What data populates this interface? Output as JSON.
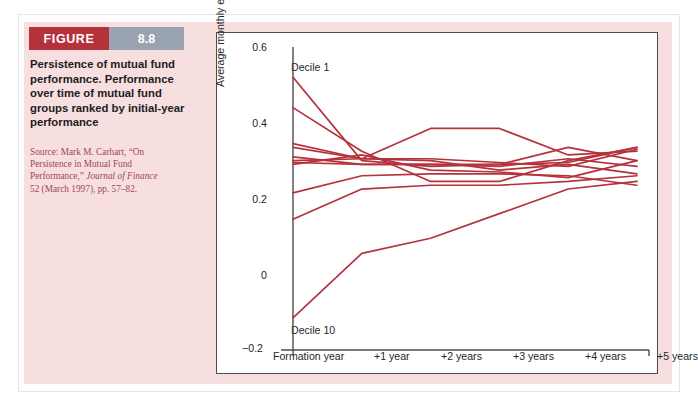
{
  "figure": {
    "label": "FIGURE",
    "number": "8.8",
    "caption": "Persistence of mutual fund performance. Performance over time of mutual fund groups ranked by initial-year performance",
    "source_line1": "Source: Mark M. Carhart, “On",
    "source_line2": "Persistence in Mutual Fund",
    "source_line3_plain": "Performance,” ",
    "source_line3_italic": "Journal of Finance",
    "source_line4": "52 (March 1997), pp. 57–82.",
    "header_bar_color": "#b5323c",
    "header_num_color": "#9aa3b0",
    "panel_color": "#f7dedf",
    "line_color": "#b5323c"
  },
  "chart_data": {
    "type": "line",
    "title": "",
    "xlabel": "",
    "ylabel": "Average monthly excess return (%)",
    "x": [
      "Formation year",
      "+1 year",
      "+2 years",
      "+3 years",
      "+4 years",
      "+5 years"
    ],
    "xtick_labels": [
      "Formation year",
      "+1 year",
      "+2 years",
      "+3 years",
      "+4 years",
      "+5 years"
    ],
    "ytick_labels": [
      "0.6",
      "0.4",
      "0.2",
      "0",
      "−0.2"
    ],
    "ytick_values": [
      0.6,
      0.4,
      0.2,
      0,
      -0.2
    ],
    "ylim": [
      -0.2,
      0.6
    ],
    "grid": false,
    "legend": "none",
    "annotations": [
      {
        "text": "Decile 1",
        "x": "Formation year",
        "y": 0.56
      },
      {
        "text": "Decile 10",
        "x": "Formation year",
        "y": -0.13
      }
    ],
    "series": [
      {
        "name": "Decile 1",
        "values": [
          0.52,
          0.3,
          0.285,
          0.29,
          0.295,
          0.335
        ]
      },
      {
        "name": "Decile 2",
        "values": [
          0.44,
          0.325,
          0.245,
          0.245,
          0.3,
          0.335
        ]
      },
      {
        "name": "Decile 3",
        "values": [
          0.345,
          0.305,
          0.385,
          0.385,
          0.315,
          0.325
        ]
      },
      {
        "name": "Decile 4",
        "values": [
          0.335,
          0.305,
          0.3,
          0.275,
          0.29,
          0.265
        ]
      },
      {
        "name": "Decile 5",
        "values": [
          0.31,
          0.29,
          0.29,
          0.285,
          0.305,
          0.285
        ]
      },
      {
        "name": "Decile 6",
        "values": [
          0.3,
          0.305,
          0.305,
          0.295,
          0.285,
          0.33
        ]
      },
      {
        "name": "Decile 7",
        "values": [
          0.295,
          0.29,
          0.29,
          0.29,
          0.335,
          0.3
        ]
      },
      {
        "name": "Decile 8",
        "values": [
          0.29,
          0.315,
          0.275,
          0.27,
          0.255,
          0.3
        ]
      },
      {
        "name": "Decile 9",
        "values": [
          0.215,
          0.26,
          0.265,
          0.265,
          0.26,
          0.235
        ]
      },
      {
        "name": "Decile 10",
        "values": [
          0.145,
          0.225,
          0.235,
          0.235,
          0.245,
          0.26
        ]
      },
      {
        "name": "Decile 10 (worst)",
        "values": [
          -0.115,
          0.055,
          0.095,
          0.16,
          0.225,
          0.245
        ]
      }
    ]
  }
}
